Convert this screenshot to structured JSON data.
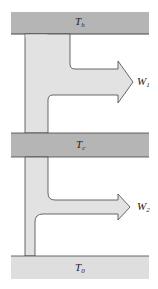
{
  "diagram": {
    "reservoirs": [
      {
        "id": "hot",
        "symbol": "T",
        "subscript": "h",
        "color": "#b5b5b5"
      },
      {
        "id": "cold",
        "symbol": "T",
        "subscript": "c",
        "color": "#b5b5b5"
      },
      {
        "id": "ambient",
        "symbol": "T",
        "subscript": "0",
        "color": "#dedede"
      }
    ],
    "work_outputs": [
      {
        "id": "w1",
        "symbol": "W",
        "subscript": "1"
      },
      {
        "id": "w2",
        "symbol": "W",
        "subscript": "2"
      }
    ],
    "colors": {
      "flow_fill": "#e2e2e2",
      "outline": "#444444"
    }
  }
}
